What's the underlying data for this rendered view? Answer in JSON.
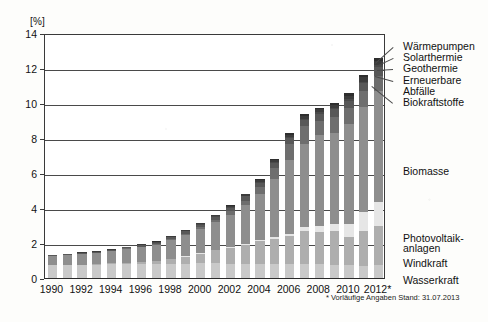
{
  "chart_data": {
    "type": "bar",
    "stacked": true,
    "title": "",
    "xlabel": "",
    "ylabel": "[%]",
    "ylim": [
      0,
      14
    ],
    "yticks": [
      0,
      2,
      4,
      6,
      8,
      10,
      12,
      14
    ],
    "grid": true,
    "legend_position": "right",
    "footnote": "* Vorläufige Angaben Stand: 31.07.2013",
    "categories": [
      "1990",
      "1991",
      "1992",
      "1993",
      "1994",
      "1995",
      "1996",
      "1997",
      "1998",
      "1999",
      "2000",
      "2001",
      "2002",
      "2003",
      "2004",
      "2005",
      "2006",
      "2007",
      "2008",
      "2009",
      "2010",
      "2011",
      "2012*"
    ],
    "xtick_labels": [
      "1990",
      "1992",
      "1994",
      "1996",
      "1998",
      "2000",
      "2002",
      "2004",
      "2006",
      "2008",
      "2010",
      "2012*"
    ],
    "series": [
      {
        "name": "Wasserkraft",
        "color": "#c9c9c9",
        "values": [
          0.72,
          0.73,
          0.75,
          0.76,
          0.78,
          0.8,
          0.79,
          0.78,
          0.8,
          0.82,
          0.84,
          0.86,
          0.82,
          0.78,
          0.82,
          0.8,
          0.78,
          0.8,
          0.78,
          0.76,
          0.76,
          0.7,
          0.76
        ]
      },
      {
        "name": "Windkraft",
        "color": "#aeaeae",
        "values": [
          0.0,
          0.01,
          0.02,
          0.03,
          0.05,
          0.08,
          0.12,
          0.18,
          0.28,
          0.4,
          0.55,
          0.72,
          0.92,
          1.12,
          1.3,
          1.45,
          1.6,
          1.9,
          1.85,
          1.9,
          1.6,
          2.0,
          2.2
        ]
      },
      {
        "name": "Photovoltaikanlagen",
        "color": "#e6e6e6",
        "values": [
          0.0,
          0.0,
          0.0,
          0.0,
          0.0,
          0.0,
          0.0,
          0.0,
          0.01,
          0.01,
          0.02,
          0.03,
          0.04,
          0.05,
          0.07,
          0.1,
          0.15,
          0.22,
          0.32,
          0.45,
          0.75,
          1.1,
          1.4
        ]
      },
      {
        "name": "Biomasse",
        "color": "#8e8e8e",
        "values": [
          0.55,
          0.58,
          0.62,
          0.66,
          0.72,
          0.8,
          0.88,
          0.95,
          1.1,
          1.25,
          1.4,
          1.6,
          1.85,
          2.2,
          2.6,
          3.3,
          4.2,
          4.75,
          5.2,
          5.2,
          5.7,
          6.0,
          6.3
        ]
      },
      {
        "name": "Biokraftstoffe",
        "color": "#6e6e6e",
        "values": [
          0.0,
          0.0,
          0.0,
          0.0,
          0.0,
          0.01,
          0.01,
          0.02,
          0.03,
          0.05,
          0.08,
          0.12,
          0.18,
          0.28,
          0.4,
          0.62,
          0.92,
          1.0,
          0.85,
          0.9,
          0.88,
          0.86,
          0.9
        ]
      },
      {
        "name": "Erneuerbare Abfälle",
        "color": "#585858",
        "values": [
          0.05,
          0.05,
          0.06,
          0.06,
          0.07,
          0.08,
          0.09,
          0.1,
          0.12,
          0.14,
          0.16,
          0.18,
          0.2,
          0.23,
          0.26,
          0.3,
          0.34,
          0.38,
          0.4,
          0.42,
          0.45,
          0.48,
          0.5
        ]
      },
      {
        "name": "Geothermie",
        "color": "#4a4a4a",
        "values": [
          0.0,
          0.0,
          0.0,
          0.0,
          0.0,
          0.0,
          0.01,
          0.01,
          0.01,
          0.02,
          0.02,
          0.02,
          0.03,
          0.03,
          0.04,
          0.04,
          0.05,
          0.05,
          0.06,
          0.06,
          0.07,
          0.08,
          0.09
        ]
      },
      {
        "name": "Solarthermie",
        "color": "#3c3c3c",
        "values": [
          0.01,
          0.01,
          0.01,
          0.02,
          0.02,
          0.03,
          0.03,
          0.04,
          0.05,
          0.06,
          0.07,
          0.08,
          0.09,
          0.1,
          0.12,
          0.14,
          0.16,
          0.18,
          0.2,
          0.21,
          0.22,
          0.24,
          0.25
        ]
      },
      {
        "name": "Wärmepumpen",
        "color": "#2e2e2e",
        "values": [
          0.0,
          0.0,
          0.0,
          0.0,
          0.0,
          0.0,
          0.0,
          0.01,
          0.01,
          0.01,
          0.02,
          0.02,
          0.03,
          0.03,
          0.04,
          0.05,
          0.06,
          0.07,
          0.08,
          0.1,
          0.12,
          0.14,
          0.16
        ]
      }
    ],
    "totals": [
      1.33,
      1.38,
      1.46,
      1.53,
      1.64,
      1.8,
      1.93,
      2.09,
      2.4,
      2.76,
      3.16,
      3.63,
      4.16,
      4.82,
      5.65,
      6.8,
      8.26,
      9.35,
      9.74,
      10.0,
      10.55,
      11.6,
      12.56
    ],
    "annotations": [
      {
        "text": "Wärmepumpen",
        "attaches_to": "Wärmepumpen"
      },
      {
        "text": "Solarthermie",
        "attaches_to": "Solarthermie"
      },
      {
        "text": "Geothermie",
        "attaches_to": "Geothermie"
      },
      {
        "text": "Erneuerbare",
        "attaches_to": "Erneuerbare Abfälle"
      },
      {
        "text": "Abfälle",
        "attaches_to": "Erneuerbare Abfälle"
      },
      {
        "text": "Biokraftstoffe",
        "attaches_to": "Biokraftstoffe"
      },
      {
        "text": "Biomasse",
        "attaches_to": "Biomasse"
      },
      {
        "text": "Photovoltaik-",
        "attaches_to": "Photovoltaikanlagen"
      },
      {
        "text": "anlagen",
        "attaches_to": "Photovoltaikanlagen"
      },
      {
        "text": "Windkraft",
        "attaches_to": "Windkraft"
      },
      {
        "text": "Wasserkraft",
        "attaches_to": "Wasserkraft"
      }
    ],
    "legend_labels": [
      "Wärmepumpen",
      "Solarthermie",
      "Geothermie",
      "Erneuerbare",
      "Abfälle",
      "Biokraftstoffe",
      "Biomasse",
      "Photovoltaik-",
      "anlagen",
      "Windkraft",
      "Wasserkraft"
    ]
  }
}
